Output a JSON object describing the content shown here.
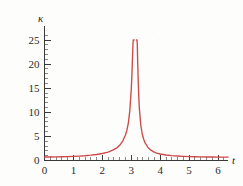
{
  "figure": {
    "background_color": "#fdfdfc",
    "axis_color": "#3a3a3a"
  },
  "chart_data": {
    "type": "line",
    "title": "",
    "subtitle": "",
    "xlabel": "t",
    "ylabel": "κ",
    "grid": false,
    "legend": "none",
    "series_color": "#cc4a4a",
    "xlim": [
      0,
      6.45
    ],
    "ylim": [
      0,
      27
    ],
    "x_ticks_major": [
      0,
      1,
      2,
      3,
      4,
      5,
      6
    ],
    "x_tick_labels": [
      "0",
      "1",
      "2",
      "3",
      "4",
      "5",
      "6"
    ],
    "x_tick_minor_step": 0.2,
    "y_ticks_major": [
      5,
      10,
      15,
      20,
      25
    ],
    "y_tick_labels": [
      "5",
      "10",
      "15",
      "20",
      "25"
    ],
    "y_zero_label": "0",
    "y_tick_minor_step": 1,
    "asymptote_x": 3.1416,
    "peak_value": 25,
    "series": [
      {
        "name": "curvature",
        "x": [
          0.0,
          0.2,
          0.4,
          0.6,
          0.8,
          1.0,
          1.2,
          1.4,
          1.6,
          1.8,
          2.0,
          2.2,
          2.4,
          2.5,
          2.6,
          2.7,
          2.8,
          2.85,
          2.9,
          2.95,
          3.0,
          3.02,
          3.04,
          3.06,
          3.07,
          3.08,
          3.09,
          3.1,
          3.18,
          3.19,
          3.2,
          3.21,
          3.22,
          3.24,
          3.26,
          3.28,
          3.33,
          3.38,
          3.43,
          3.48,
          3.58,
          3.68,
          3.78,
          3.88,
          4.0,
          4.2,
          4.4,
          4.6,
          4.8,
          5.0,
          5.2,
          5.4,
          5.6,
          5.8,
          6.0,
          6.2,
          6.35
        ],
        "y": [
          0.72,
          0.73,
          0.74,
          0.77,
          0.8,
          0.85,
          0.91,
          0.99,
          1.1,
          1.25,
          1.45,
          1.75,
          2.25,
          2.62,
          3.15,
          3.95,
          5.3,
          6.3,
          7.8,
          10.3,
          14.8,
          17.3,
          20.8,
          24.2,
          25.0,
          25.0,
          25.0,
          25.0,
          25.0,
          25.0,
          25.0,
          24.0,
          21.0,
          16.8,
          13.2,
          10.8,
          7.3,
          5.5,
          4.4,
          3.65,
          2.7,
          2.15,
          1.8,
          1.55,
          1.35,
          1.15,
          1.02,
          0.93,
          0.86,
          0.81,
          0.78,
          0.75,
          0.73,
          0.72,
          0.71,
          0.71,
          0.71
        ]
      }
    ]
  },
  "labels": {
    "y_axis_symbol": "κ",
    "x_axis_symbol": "t"
  }
}
